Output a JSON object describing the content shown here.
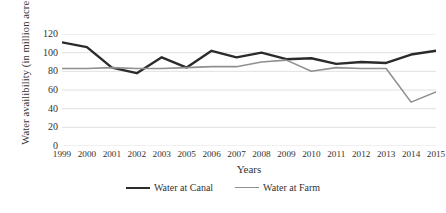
{
  "chart_data": {
    "type": "line",
    "title": "",
    "xlabel": "Years",
    "ylabel": "Water availibility (in million acre feet)",
    "categories": [
      "1999",
      "2000",
      "2001",
      "2002",
      "2003",
      "2005",
      "2006",
      "2007",
      "2008",
      "2009",
      "2010",
      "2011",
      "2012",
      "2013",
      "2014",
      "2015"
    ],
    "yticks": [
      120,
      100,
      80,
      60,
      40,
      20,
      0
    ],
    "ylim": [
      0,
      120
    ],
    "grid": "horizontal",
    "legend_position": "bottom-center",
    "series": [
      {
        "name": "Water at Canal",
        "color": "#2b2b2b",
        "width": 2.4,
        "values": [
          111,
          106,
          84,
          78,
          95,
          84,
          102,
          95,
          100,
          93,
          94,
          88,
          90,
          89,
          98,
          102
        ]
      },
      {
        "name": "Water at Farm",
        "color": "#909090",
        "width": 1.6,
        "values": [
          83,
          83,
          84,
          83,
          83,
          84,
          85,
          85,
          90,
          92,
          80,
          84,
          83,
          83,
          47,
          58
        ]
      }
    ]
  },
  "legend": {
    "items": [
      {
        "label": "Water at Canal"
      },
      {
        "label": "Water at Farm"
      }
    ]
  },
  "axes": {
    "x_title": "Years",
    "y_title": "Water availibility (in million acre feet)"
  }
}
